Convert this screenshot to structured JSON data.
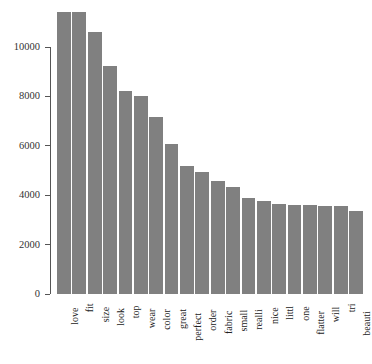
{
  "chart_data": {
    "type": "bar",
    "title": "",
    "subtitle": "",
    "xlabel": "",
    "ylabel": "",
    "categories": [
      "love",
      "fit",
      "size",
      "look",
      "top",
      "wear",
      "color",
      "great",
      "perfect",
      "order",
      "fabric",
      "small",
      "realli",
      "nice",
      "littl",
      "one",
      "flatter",
      "will",
      "tri",
      "beauti"
    ],
    "values": [
      11420,
      11400,
      10610,
      9230,
      8220,
      8030,
      7180,
      6090,
      5200,
      4930,
      4580,
      4340,
      3880,
      3750,
      3660,
      3620,
      3600,
      3570,
      3560,
      3370
    ],
    "ylim": [
      0,
      11500
    ],
    "yticks": [
      0,
      2000,
      4000,
      6000,
      8000,
      10000
    ],
    "ytick_labels": [
      "0",
      "2000",
      "4000",
      "6000",
      "8000",
      "10000"
    ],
    "grid": false,
    "legend": false,
    "legend_position": "none",
    "bar_color": "#808080",
    "axis_color": "#555555",
    "background_color": "#ffffff",
    "orientation": "vertical"
  }
}
